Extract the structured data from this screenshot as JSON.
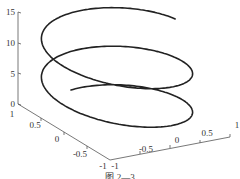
{
  "chart_data": {
    "type": "line",
    "subtype": "3d-line (helix)",
    "title": "",
    "equation": {
      "x": "sin(t)",
      "y": "cos(t)",
      "z": "t"
    },
    "t_range": [
      0,
      14.1
    ],
    "xlabel": "",
    "ylabel": "",
    "zlabel": "",
    "xlim": [
      -1,
      1
    ],
    "ylim": [
      -1,
      1
    ],
    "zlim": [
      0,
      15
    ],
    "x_ticks": [
      "-1",
      "-0.5",
      "0",
      "0.5",
      "1"
    ],
    "y_ticks": [
      "1",
      "0.5",
      "0",
      "-0.5",
      "-1"
    ],
    "z_ticks": [
      "0",
      "5",
      "10",
      "15"
    ],
    "grid": false,
    "legend": null,
    "line_color": "#222222"
  },
  "caption": "图 2—3"
}
